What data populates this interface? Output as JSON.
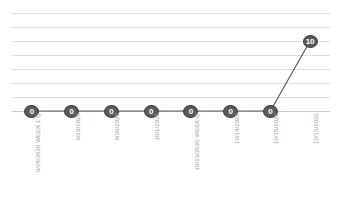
{
  "chart_data": {
    "type": "line",
    "title": "",
    "xlabel": "",
    "ylabel": "",
    "categories": [
      "9/28/2020 WEEK 1 Q",
      "9/29/2020",
      "9/30/2020",
      "10/1/2020",
      "10/13/2020 WEEK Q",
      "10/14/2020",
      "10/15/2020",
      "10/16/2020"
    ],
    "values": [
      0,
      0,
      0,
      0,
      0,
      0,
      0,
      10
    ],
    "data_labels": [
      "0",
      "0",
      "0",
      "0",
      "0",
      "0",
      "0",
      "10"
    ],
    "ylim": [
      0,
      14
    ],
    "y_gridline_count": 8,
    "grid": true,
    "legend": "none",
    "series_color": "#595959",
    "marker_fill": "#5a5a5a",
    "marker_label_color": "#ffffff",
    "gridline_color": "#dedede",
    "axis_label_color": "#9b9b9b"
  }
}
